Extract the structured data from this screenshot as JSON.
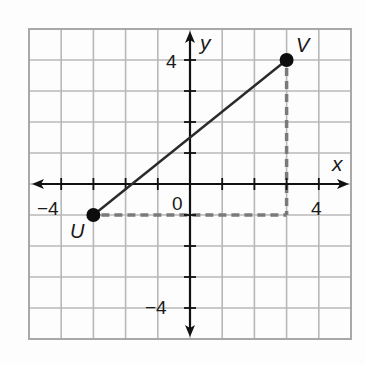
{
  "chart_data": {
    "type": "scatter",
    "title": "",
    "xlabel": "x",
    "ylabel": "y",
    "xlim": [
      -5,
      5
    ],
    "ylim": [
      -5,
      5
    ],
    "grid": true,
    "grid_step": 1,
    "x_tick_labels": [
      {
        "value": -4,
        "label": "−4"
      },
      {
        "value": 0,
        "label": "0"
      },
      {
        "value": 4,
        "label": "4"
      }
    ],
    "y_tick_labels": [
      {
        "value": 4,
        "label": "4"
      },
      {
        "value": -4,
        "label": "−4"
      }
    ],
    "points": [
      {
        "name": "U",
        "x": -3,
        "y": -1
      },
      {
        "name": "V",
        "x": 3,
        "y": 4
      }
    ],
    "segments": [
      {
        "from": "U",
        "to": "V",
        "style": "solid",
        "label": "segment UV"
      },
      {
        "from": [
          -3,
          -1
        ],
        "to": [
          3,
          -1
        ],
        "style": "dashed",
        "label": "horizontal leg"
      },
      {
        "from": [
          3,
          4
        ],
        "to": [
          3,
          -1
        ],
        "style": "dashed",
        "label": "vertical leg"
      }
    ]
  },
  "axes": {
    "x_label": "x",
    "y_label": "y",
    "origin_label": "0",
    "x_neg_label": "−4",
    "x_pos_label": "4",
    "y_pos_label": "4",
    "y_neg_label": "−4"
  },
  "points": {
    "U": {
      "label": "U"
    },
    "V": {
      "label": "V"
    }
  },
  "colors": {
    "grid": "#b8b8b8",
    "border": "#a8a8a8",
    "axis": "#111111",
    "segment": "#2a2a2a",
    "dashed": "#7a7a7a",
    "point": "#0d0d0d"
  }
}
